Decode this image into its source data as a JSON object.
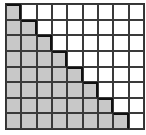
{
  "diagram": {
    "type": "staircase-grid",
    "columns": 9,
    "rows": 8,
    "shaded_per_row": [
      1,
      2,
      3,
      4,
      5,
      6,
      7,
      8
    ],
    "colors": {
      "shaded": "#c8c8c8",
      "unshaded": "#ffffff",
      "grid_line": "#3a3a3a",
      "staircase_line": "#111111"
    }
  }
}
